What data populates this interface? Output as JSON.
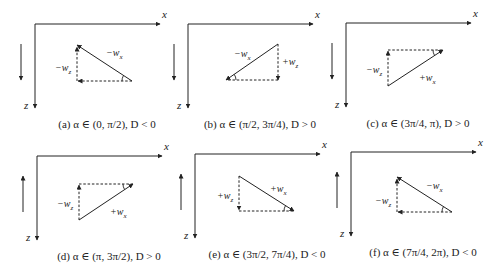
{
  "figure": {
    "panels": [
      {
        "id": "a",
        "caption": "(a) α ∈ (0, π/2), D < 0",
        "axis_x": "x",
        "axis_z": "z",
        "direction": "down",
        "ox": 35,
        "oy": 24,
        "tri": [
          [
            77,
            45
          ],
          [
            77,
            81
          ],
          [
            132,
            81
          ]
        ],
        "labels": [
          {
            "text": "−w",
            "sub": "x",
            "x": 106,
            "y": 47
          },
          {
            "text": "−w",
            "sub": "z",
            "x": 55,
            "y": 62
          }
        ]
      },
      {
        "id": "b",
        "caption": "(b) α ∈ (π/2, 3π/4), D > 0",
        "axis_x": "x",
        "axis_z": "z",
        "direction": "down",
        "ox": 188,
        "oy": 24,
        "tri": [
          [
            226,
            80
          ],
          [
            278,
            44
          ],
          [
            278,
            80
          ]
        ],
        "labels": [
          {
            "text": "−w",
            "sub": "x",
            "x": 234,
            "y": 48
          },
          {
            "text": "+w",
            "sub": "z",
            "x": 282,
            "y": 56
          }
        ]
      },
      {
        "id": "c",
        "caption": "(c) α ∈ (3π/4, π), D > 0",
        "axis_x": "x",
        "axis_z": "z",
        "direction": "down",
        "ox": 346,
        "oy": 23,
        "tri": [
          [
            388,
            50
          ],
          [
            443,
            50
          ],
          [
            388,
            86
          ]
        ],
        "labels": [
          {
            "text": "−w",
            "sub": "z",
            "x": 366,
            "y": 64
          },
          {
            "text": "+w",
            "sub": "x",
            "x": 419,
            "y": 72
          }
        ]
      },
      {
        "id": "d",
        "caption": "(d) α ∈ (π, 3π/2), D > 0",
        "axis_x": "x",
        "axis_z": "z",
        "direction": "up",
        "ox": 37,
        "oy": 156,
        "tri": [
          [
            79,
            184
          ],
          [
            133,
            184
          ],
          [
            79,
            220
          ]
        ],
        "labels": [
          {
            "text": "−w",
            "sub": "z",
            "x": 57,
            "y": 198
          },
          {
            "text": "+w",
            "sub": "x",
            "x": 110,
            "y": 206
          }
        ]
      },
      {
        "id": "e",
        "caption": "(e) α ∈ (3π/2, 7π/4), D < 0",
        "axis_x": "x",
        "axis_z": "z",
        "direction": "up",
        "ox": 195,
        "oy": 154,
        "tri": [
          [
            239,
            176
          ],
          [
            239,
            211
          ],
          [
            294,
            211
          ]
        ],
        "labels": [
          {
            "text": "+w",
            "sub": "z",
            "x": 217,
            "y": 190
          },
          {
            "text": "+w",
            "sub": "x",
            "x": 270,
            "y": 183
          }
        ]
      },
      {
        "id": "f",
        "caption": "(f) α ∈ (7π/4, 2π), D < 0",
        "axis_x": "x",
        "axis_z": "z",
        "direction": "up",
        "ox": 351,
        "oy": 152,
        "tri": [
          [
            397,
            177
          ],
          [
            397,
            212
          ],
          [
            452,
            212
          ]
        ],
        "labels": [
          {
            "text": "−w",
            "sub": "x",
            "x": 426,
            "y": 180
          },
          {
            "text": "−w",
            "sub": "z",
            "x": 375,
            "y": 195
          }
        ]
      }
    ]
  },
  "colors": {
    "stroke": "#222222",
    "background": "#ffffff"
  }
}
